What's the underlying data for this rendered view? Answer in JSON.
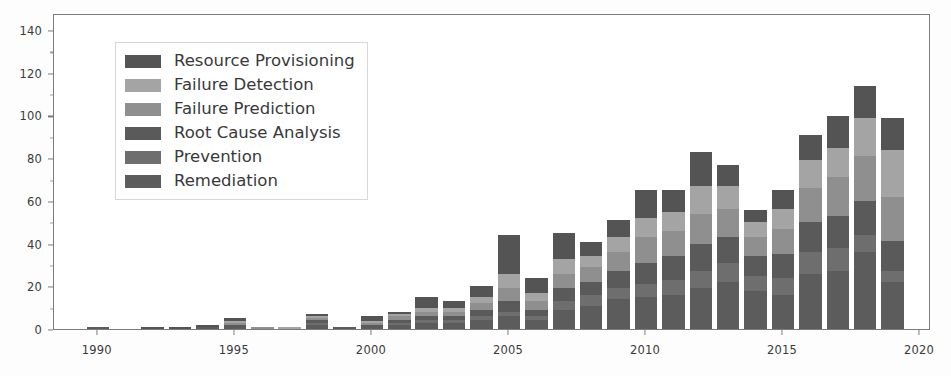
{
  "chart_data": {
    "type": "bar",
    "stacked": true,
    "title": "",
    "xlabel": "",
    "ylabel": "",
    "xlim": [
      1988.4,
      2020.4
    ],
    "ylim": [
      0,
      148
    ],
    "grid": false,
    "legend_position": "upper-left",
    "xticks": [
      "1990",
      "1995",
      "2000",
      "2005",
      "2010",
      "2015",
      "2020"
    ],
    "xtick_values": [
      1990,
      1995,
      2000,
      2005,
      2010,
      2015,
      2020
    ],
    "yticks": [
      "0",
      "20",
      "40",
      "60",
      "80",
      "100",
      "120",
      "140"
    ],
    "ytick_values": [
      0,
      20,
      40,
      60,
      80,
      100,
      120,
      140
    ],
    "categories": [
      1989,
      1990,
      1991,
      1992,
      1993,
      1994,
      1995,
      1996,
      1997,
      1998,
      1999,
      2000,
      2001,
      2002,
      2003,
      2004,
      2005,
      2006,
      2007,
      2008,
      2009,
      2010,
      2011,
      2012,
      2013,
      2014,
      2015,
      2016,
      2017,
      2018,
      2019
    ],
    "series": [
      {
        "name": "Remediation",
        "color": "#5c5c5c",
        "values": [
          0,
          1,
          0,
          0,
          0,
          1,
          1,
          0,
          0,
          2,
          1,
          1,
          2,
          3,
          3,
          4,
          6,
          4,
          9,
          11,
          14,
          15,
          16,
          19,
          22,
          18,
          16,
          26,
          27,
          36,
          22
        ]
      },
      {
        "name": "Prevention",
        "color": "#6e6e6e",
        "values": [
          0,
          0,
          0,
          0,
          0,
          0,
          0,
          0,
          0,
          1,
          0,
          0,
          1,
          1,
          1,
          2,
          2,
          2,
          4,
          5,
          5,
          6,
          7,
          8,
          9,
          7,
          8,
          10,
          11,
          8,
          5
        ]
      },
      {
        "name": "Root Cause Analysis",
        "color": "#5a5a5a",
        "values": [
          0,
          0,
          0,
          0,
          0,
          0,
          1,
          0,
          0,
          1,
          0,
          1,
          1,
          2,
          2,
          3,
          5,
          3,
          6,
          6,
          8,
          10,
          11,
          13,
          12,
          9,
          11,
          14,
          15,
          16,
          14
        ]
      },
      {
        "name": "Failure Prediction",
        "color": "#8f8f8f",
        "values": [
          0,
          0,
          0,
          0,
          0,
          0,
          1,
          1,
          0,
          1,
          0,
          1,
          2,
          2,
          2,
          3,
          6,
          4,
          7,
          7,
          9,
          12,
          12,
          14,
          13,
          9,
          12,
          16,
          18,
          21,
          21
        ]
      },
      {
        "name": "Failure Detection",
        "color": "#a4a4a4",
        "values": [
          0,
          0,
          0,
          0,
          0,
          0,
          1,
          0,
          1,
          1,
          0,
          1,
          1,
          2,
          2,
          3,
          7,
          4,
          7,
          5,
          7,
          9,
          9,
          13,
          11,
          7,
          9,
          13,
          14,
          18,
          22
        ]
      },
      {
        "name": "Resource Provisioning",
        "color": "#545454",
        "values": [
          0,
          0,
          0,
          1,
          1,
          1,
          1,
          0,
          0,
          1,
          0,
          2,
          1,
          5,
          3,
          5,
          18,
          7,
          12,
          7,
          8,
          13,
          10,
          16,
          10,
          6,
          9,
          12,
          15,
          15,
          15
        ]
      }
    ],
    "totals": [
      0,
      1,
      0,
      1,
      1,
      2,
      5,
      1,
      1,
      7,
      1,
      6,
      8,
      15,
      13,
      20,
      44,
      24,
      45,
      41,
      51,
      65,
      65,
      83,
      77,
      56,
      65,
      91,
      100,
      114,
      99
    ]
  },
  "legend": {
    "items": [
      {
        "label": "Resource Provisioning",
        "color": "#545454",
        "swatch_name": "legend-swatch-resource-provisioning"
      },
      {
        "label": "Failure Detection",
        "color": "#a4a4a4",
        "swatch_name": "legend-swatch-failure-detection"
      },
      {
        "label": "Failure Prediction",
        "color": "#8f8f8f",
        "swatch_name": "legend-swatch-failure-prediction"
      },
      {
        "label": "Root Cause Analysis",
        "color": "#5a5a5a",
        "swatch_name": "legend-swatch-root-cause-analysis"
      },
      {
        "label": "Prevention",
        "color": "#6e6e6e",
        "swatch_name": "legend-swatch-prevention"
      },
      {
        "label": "Remediation",
        "color": "#5c5c5c",
        "swatch_name": "legend-swatch-remediation"
      }
    ]
  },
  "axis_style": {
    "frame_color": "#7c7c7c",
    "tick_label_color": "#3a3a3a",
    "background": "#ffffff"
  }
}
